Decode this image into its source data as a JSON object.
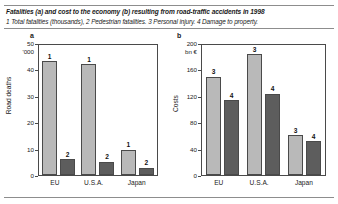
{
  "caption": {
    "line1": "Fatalities (a) and cost to the economy (b) resulting from road-traffic accidents in 1998",
    "line2": "1 Total fatalities (thousands), 2 Pedestrian fatalities. 3 Personal injury. 4 Damage to property."
  },
  "panels": {
    "a": {
      "letter": "a"
    },
    "b": {
      "letter": "b"
    }
  },
  "chart_data": [
    {
      "type": "bar",
      "panel": "a",
      "title": "",
      "xlabel": "",
      "ylabel": "Road deaths",
      "yunit": "'000",
      "ylim": [
        0,
        50
      ],
      "yticks": [
        0,
        10,
        20,
        30,
        40,
        50
      ],
      "ytick_labels": [
        "0",
        "10",
        "20",
        "30",
        "40",
        "50"
      ],
      "grid": false,
      "categories": [
        "EU",
        "U.S.A.",
        "Japan"
      ],
      "series": [
        {
          "name": "1",
          "label": "Total fatalities (thousands)",
          "color": "#b9b9b9",
          "values": [
            43,
            42,
            9.5
          ]
        },
        {
          "name": "2",
          "label": "Pedestrian fatalities",
          "color": "#5d5d5d",
          "values": [
            6,
            5,
            2.8
          ]
        }
      ]
    },
    {
      "type": "bar",
      "panel": "b",
      "title": "",
      "xlabel": "",
      "ylabel": "Costs",
      "yunit": "bn €",
      "ylim": [
        0,
        200
      ],
      "yticks": [
        0,
        40,
        80,
        120,
        160,
        200
      ],
      "ytick_labels": [
        "0",
        "40",
        "80",
        "120",
        "160",
        "200"
      ],
      "grid": false,
      "categories": [
        "EU",
        "U.S.A.",
        "Japan"
      ],
      "series": [
        {
          "name": "3",
          "label": "Personal injury",
          "color": "#b9b9b9",
          "values": [
            149,
            183,
            60
          ]
        },
        {
          "name": "4",
          "label": "Damage to property",
          "color": "#5d5d5d",
          "values": [
            113,
            123,
            51
          ]
        }
      ]
    }
  ]
}
